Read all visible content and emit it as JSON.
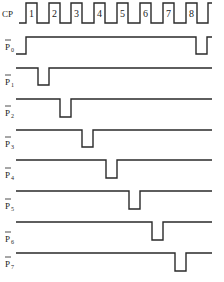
{
  "diagram": {
    "type": "timing-diagram",
    "clock": {
      "label": "CP",
      "pulse_labels": [
        "1",
        "2",
        "3",
        "4",
        "5",
        "6",
        "7",
        "8"
      ]
    },
    "outputs": [
      {
        "name": "P0",
        "label": "P",
        "sub": "0",
        "active": "low",
        "low_at": [
          "before-1",
          "after-8"
        ]
      },
      {
        "name": "P1",
        "label": "P",
        "sub": "1",
        "active": "low",
        "low_at": [
          "1"
        ]
      },
      {
        "name": "P2",
        "label": "P",
        "sub": "2",
        "active": "low",
        "low_at": [
          "2"
        ]
      },
      {
        "name": "P3",
        "label": "P",
        "sub": "3",
        "active": "low",
        "low_at": [
          "3"
        ]
      },
      {
        "name": "P4",
        "label": "P",
        "sub": "4",
        "active": "low",
        "low_at": [
          "4"
        ]
      },
      {
        "name": "P5",
        "label": "P",
        "sub": "5",
        "active": "low",
        "low_at": [
          "5"
        ]
      },
      {
        "name": "P6",
        "label": "P",
        "sub": "6",
        "active": "low",
        "low_at": [
          "6"
        ]
      },
      {
        "name": "P7",
        "label": "P",
        "sub": "7",
        "active": "low",
        "low_at": [
          "7"
        ]
      }
    ]
  }
}
